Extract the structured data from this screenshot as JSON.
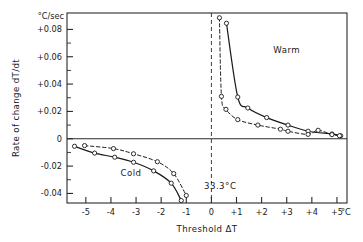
{
  "chart_data": {
    "type": "line",
    "title": "",
    "xlabel": "Threshold ΔT",
    "ylabel": "Rate of change dT/dt",
    "y_unit_label": "°C/sec",
    "x_unit_label": "°C",
    "xlim": [
      -5.75,
      5.4
    ],
    "ylim": [
      -0.047,
      0.092
    ],
    "grid": false,
    "legend_position": "none",
    "x_ticks": [
      -5,
      -4,
      -3,
      -2,
      -1,
      0,
      1,
      2,
      3,
      4,
      5
    ],
    "x_tick_labels": [
      "-5",
      "-4",
      "-3",
      "-2",
      "-1",
      "0",
      "+1",
      "+2",
      "+3",
      "+4",
      "+5"
    ],
    "y_ticks": [
      -0.04,
      -0.03,
      -0.02,
      -0.01,
      0,
      0.01,
      0.02,
      0.03,
      0.04,
      0.05,
      0.06,
      0.07,
      0.08
    ],
    "y_major_ticks": [
      -0.04,
      -0.02,
      0,
      0.02,
      0.04,
      0.06,
      0.08
    ],
    "y_tick_labels": [
      "-0.04",
      "-0.02",
      "0",
      "+0.02",
      "+0.04",
      "+0.06",
      "+0.08"
    ],
    "annotations": [
      {
        "name": "warm-region-label",
        "text": "Warm",
        "x": 3.0,
        "y": 0.063
      },
      {
        "name": "cold-region-label",
        "text": "Cold",
        "x": -3.2,
        "y": -0.027
      },
      {
        "name": "baseline-temperature-label",
        "text": "33.3°C",
        "x": 0.35,
        "y": -0.037
      }
    ],
    "reference_lines": [
      {
        "name": "zero-rate-line",
        "orientation": "horizontal",
        "value": 0,
        "style": "solid"
      },
      {
        "name": "neutral-threshold-line",
        "orientation": "vertical",
        "value": 0,
        "style": "dashed"
      }
    ],
    "series": [
      {
        "name": "Warm solid",
        "style": "solid",
        "marker": "open-circle",
        "points": [
          [
            0.6,
            0.0845
          ],
          [
            1.05,
            0.0305
          ],
          [
            1.45,
            0.0225
          ],
          [
            2.2,
            0.0155
          ],
          [
            3.05,
            0.01
          ],
          [
            3.85,
            0.0055
          ],
          [
            4.8,
            0.0035
          ],
          [
            5.15,
            0.0022
          ]
        ]
      },
      {
        "name": "Warm dashed",
        "style": "dashed",
        "marker": "open-circle",
        "points": [
          [
            0.32,
            0.0885
          ],
          [
            0.4,
            0.031
          ],
          [
            0.58,
            0.0215
          ],
          [
            1.05,
            0.014
          ],
          [
            1.85,
            0.01
          ],
          [
            2.75,
            0.007
          ],
          [
            3.05,
            0.0055
          ],
          [
            3.85,
            0.0032
          ],
          [
            4.25,
            0.0062
          ],
          [
            4.8,
            0.003
          ],
          [
            5.1,
            0.0022
          ]
        ]
      },
      {
        "name": "Cold solid",
        "style": "solid",
        "marker": "open-circle",
        "points": [
          [
            -5.45,
            -0.0055
          ],
          [
            -4.65,
            -0.0105
          ],
          [
            -3.85,
            -0.0135
          ],
          [
            -3.1,
            -0.0172
          ],
          [
            -2.3,
            -0.0235
          ],
          [
            -1.6,
            -0.0325
          ],
          [
            -1.2,
            -0.0452
          ]
        ]
      },
      {
        "name": "Cold dashed",
        "style": "dashed",
        "marker": "open-circle",
        "points": [
          [
            -5.05,
            -0.005
          ],
          [
            -3.9,
            -0.0072
          ],
          [
            -3.1,
            -0.011
          ],
          [
            -2.15,
            -0.0168
          ],
          [
            -1.5,
            -0.0255
          ],
          [
            -1.0,
            -0.0415
          ]
        ]
      }
    ]
  }
}
